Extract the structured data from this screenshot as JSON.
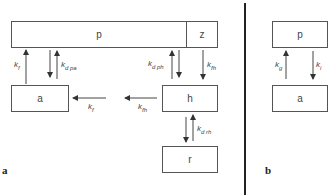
{
  "panel_a": {
    "label": "a",
    "boxes": {
      "p": "p",
      "z": "z",
      "a": "a",
      "h": "h",
      "r": "r"
    },
    "rates": {
      "kf_up": {
        "k": "k",
        "sub": "f"
      },
      "kd_pa": {
        "k": "k",
        "sub": "d  pa"
      },
      "kd_ph": {
        "k": "k",
        "sub": "d  ph"
      },
      "kfh_down": {
        "k": "k",
        "sub": "fh"
      },
      "kf_left": {
        "k": "k",
        "sub": "f"
      },
      "kfh_left": {
        "k": "k",
        "sub": "fh"
      },
      "kd_rh": {
        "k": "k",
        "sub": "d  rh"
      }
    }
  },
  "panel_b": {
    "label": "b",
    "boxes": {
      "p": "p",
      "a": "a"
    },
    "rates": {
      "kg": {
        "k": "k",
        "sub": "g"
      },
      "ki": {
        "k": "k",
        "sub": "i"
      }
    }
  }
}
